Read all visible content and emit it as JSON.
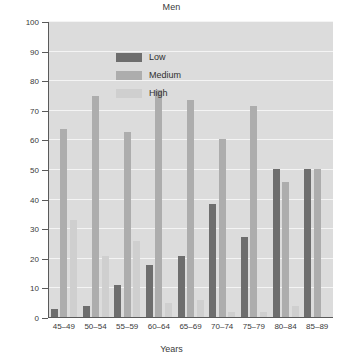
{
  "chart_data": {
    "type": "bar",
    "title": "Men",
    "xlabel": "Years",
    "ylabel": "Percentage",
    "categories": [
      "45–49",
      "50–54",
      "55–59",
      "60–64",
      "65–69",
      "70–74",
      "75–79",
      "80–84",
      "85–89"
    ],
    "series": [
      {
        "name": "Low",
        "color": "#6e6e6e",
        "values": [
          3,
          4,
          11,
          18,
          21,
          38.5,
          27.5,
          50.5,
          50.5
        ]
      },
      {
        "name": "Medium",
        "color": "#adadad",
        "values": [
          64,
          75,
          63,
          77,
          73.5,
          60.5,
          71.5,
          46,
          50.5
        ]
      },
      {
        "name": "High",
        "color": "#cfcfcf",
        "values": [
          33,
          21,
          26,
          5,
          6,
          2,
          2,
          4,
          0
        ]
      }
    ],
    "ylim": [
      0,
      100
    ],
    "yticks": [
      0,
      10,
      20,
      30,
      40,
      50,
      60,
      70,
      80,
      90,
      100
    ],
    "grid": true,
    "legend_position": "upper-left-inside",
    "plot_background": "#dcdcdc",
    "gridline_color": "#f4f4f4",
    "axis_color": "#5a5a5a"
  }
}
